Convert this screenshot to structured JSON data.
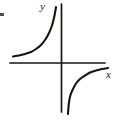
{
  "figure": {
    "kind": "math-graph",
    "background_color": "#ffffff",
    "ink_color": "#17140f",
    "width": 119,
    "height": 121
  },
  "axes": {
    "x_label": "x",
    "y_label": "y",
    "origin": {
      "x": 61.5,
      "y": 63
    },
    "x_axis": {
      "x1": 10,
      "y1": 63,
      "x2": 105,
      "y2": 63,
      "stroke_width": 1.6
    },
    "y_axis": {
      "x1": 61.5,
      "y1": 4,
      "x2": 61.5,
      "y2": 112,
      "stroke_width": 1.6
    },
    "ticks": [],
    "tick_labels": [],
    "grid": false
  },
  "chart_data": {
    "type": "line",
    "title": "",
    "subtitle": "",
    "xlabel": "x",
    "ylabel": "y",
    "grid": false,
    "legend": null,
    "annotations": [],
    "xlim": [
      -52,
      44
    ],
    "ylim": [
      -49,
      59
    ],
    "series": [
      {
        "name": "upper-left-branch",
        "quadrant": "II",
        "points_px": [
          [
            13,
            56.5
          ],
          [
            19,
            55.5
          ],
          [
            25,
            54
          ],
          [
            31,
            52
          ],
          [
            36,
            49
          ],
          [
            41,
            45
          ],
          [
            45,
            40
          ],
          [
            48.5,
            34
          ],
          [
            51.5,
            27
          ],
          [
            53.5,
            20
          ],
          [
            55,
            13
          ],
          [
            56,
            7
          ]
        ],
        "endpoints_px": {
          "start": [
            13,
            56.5
          ],
          "end": [
            56,
            7
          ]
        }
      },
      {
        "name": "lower-right-branch",
        "quadrant": "IV",
        "points_px": [
          [
            108,
            68
          ],
          [
            102,
            69
          ],
          [
            96,
            70.5
          ],
          [
            90,
            72.5
          ],
          [
            85,
            75.5
          ],
          [
            80,
            79
          ],
          [
            76,
            83.5
          ],
          [
            73,
            89
          ],
          [
            70.5,
            95
          ],
          [
            69.2,
            101
          ],
          [
            68.4,
            108
          ],
          [
            68,
            114
          ]
        ],
        "endpoints_px": {
          "start": [
            108,
            68
          ],
          "end": [
            68,
            114
          ]
        }
      }
    ]
  }
}
